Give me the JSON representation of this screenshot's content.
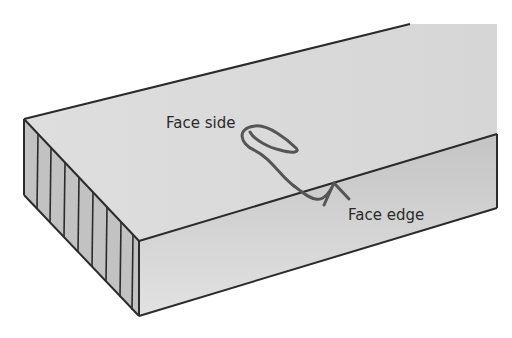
{
  "diagram": {
    "labels": {
      "face_side": "Face side",
      "face_edge": "Face edge"
    },
    "colors": {
      "top_face": "#dcdcdc",
      "front_face": "#c9c9c9",
      "end_grain": "#bdbdbd",
      "outline": "#2b2b2b",
      "mark": "#555555"
    }
  }
}
